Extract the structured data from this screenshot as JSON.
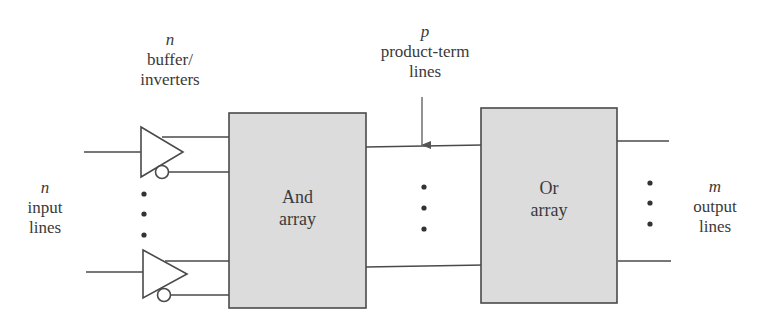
{
  "diagram": {
    "type": "block-diagram",
    "labels": {
      "buffers": {
        "var": "n",
        "line1": "buffer/",
        "line2": "inverters"
      },
      "inputs": {
        "var": "n",
        "line1": "input",
        "line2": "lines"
      },
      "product_terms": {
        "var": "p",
        "line1": "product-term",
        "line2": "lines"
      },
      "outputs": {
        "var": "m",
        "line1": "output",
        "line2": "lines"
      }
    },
    "blocks": [
      {
        "id": "and-array",
        "line1": "And",
        "line2": "array"
      },
      {
        "id": "or-array",
        "line1": "Or",
        "line2": "array"
      }
    ],
    "colors": {
      "block_fill": "#dcdcdc",
      "stroke": "#4a4a4a",
      "background": "#ffffff"
    },
    "connections": [
      {
        "from": "input-lines",
        "to": "buffer-inverters"
      },
      {
        "from": "buffer-inverters",
        "to": "and-array"
      },
      {
        "from": "and-array",
        "to": "or-array",
        "via": "product-term-lines"
      },
      {
        "from": "or-array",
        "to": "output-lines"
      }
    ]
  }
}
